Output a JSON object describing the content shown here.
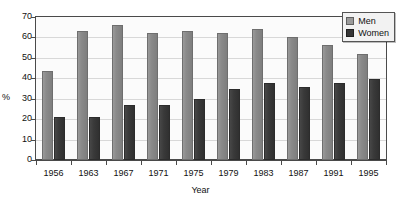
{
  "chart_data": {
    "type": "bar",
    "title": "",
    "xlabel": "Year",
    "ylabel": "%",
    "categories": [
      "1956",
      "1963",
      "1967",
      "1971",
      "1975",
      "1979",
      "1983",
      "1987",
      "1991",
      "1995"
    ],
    "series": [
      {
        "name": "Men",
        "color": "#8a8a8a",
        "values": [
          43.5,
          63,
          66,
          62,
          63,
          62,
          64,
          60,
          56.5,
          52
        ]
      },
      {
        "name": "Women",
        "color": "#3a3a3a",
        "values": [
          21,
          21,
          27,
          27,
          30,
          35,
          37.5,
          35.5,
          37.5,
          39.5
        ]
      }
    ],
    "ylim": [
      0,
      70
    ],
    "yticks": [
      "0",
      "10",
      "20",
      "30",
      "40",
      "50",
      "60",
      "70"
    ],
    "grid": true,
    "legend_position": "top-right"
  },
  "legend": {
    "items": [
      {
        "label": "Men"
      },
      {
        "label": "Women"
      }
    ]
  },
  "axes": {
    "y_title": "%",
    "x_title": "Year"
  }
}
